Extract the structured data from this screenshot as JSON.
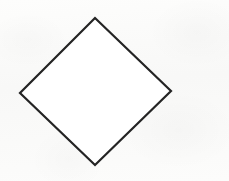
{
  "figure": {
    "canvas": {
      "width": 229,
      "height": 181,
      "background_color": "#fbfbfa"
    },
    "shape": {
      "name": "diamond",
      "kind": "rotated-square",
      "sides": 4,
      "fill": "none",
      "fill_color": "#ffffff",
      "stroke_color": "#242424",
      "stroke_width": 2.2,
      "points": "95,18 171,91 95,165 20,93",
      "vertices": [
        {
          "label": "top",
          "x": 95,
          "y": 18
        },
        {
          "label": "right",
          "x": 171,
          "y": 91
        },
        {
          "label": "bottom",
          "x": 95,
          "y": 165
        },
        {
          "label": "left",
          "x": 20,
          "y": 93
        }
      ]
    }
  }
}
